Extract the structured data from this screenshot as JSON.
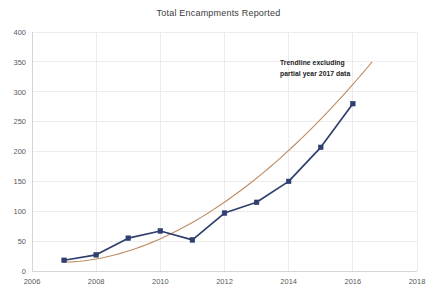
{
  "chart_data": {
    "type": "line",
    "title": "Total Encampments Reported",
    "xlabel": "",
    "ylabel": "",
    "xlim": [
      2006,
      2018
    ],
    "ylim": [
      0,
      400
    ],
    "x_ticks": [
      "2006",
      "2008",
      "2010",
      "2012",
      "2014",
      "2016",
      "2018"
    ],
    "y_ticks": [
      "0",
      "50",
      "100",
      "150",
      "200",
      "250",
      "300",
      "350",
      "400"
    ],
    "grid": true,
    "legend_position": "none",
    "x": [
      2007,
      2008,
      2009,
      2010,
      2011,
      2012,
      2013,
      2014,
      2015,
      2016
    ],
    "series": [
      {
        "name": "Total Encampments Reported",
        "color": "#2f3f6e",
        "marker": "square",
        "values": [
          18,
          27,
          55,
          67,
          52,
          97,
          115,
          150,
          207,
          280
        ]
      }
    ],
    "trendline": {
      "name": "Trendline excluding partial year 2017 data",
      "color": "#bd8c63",
      "x": [
        2007,
        2016.6
      ],
      "values": [
        15,
        350
      ]
    },
    "annotations": [
      {
        "name": "trendline-note",
        "lines": [
          "Trendline excluding",
          "partial year 2017 data"
        ],
        "x": 2014.6,
        "y": 345
      }
    ]
  },
  "colors": {
    "series_line": "#2f3f6e",
    "trendline": "#bd8c63",
    "grid": "#ececec",
    "axis": "#d5d5d5",
    "title_text": "#3b3b3b",
    "tick_text": "#595959",
    "annotation_text": "#1a1a1a"
  }
}
